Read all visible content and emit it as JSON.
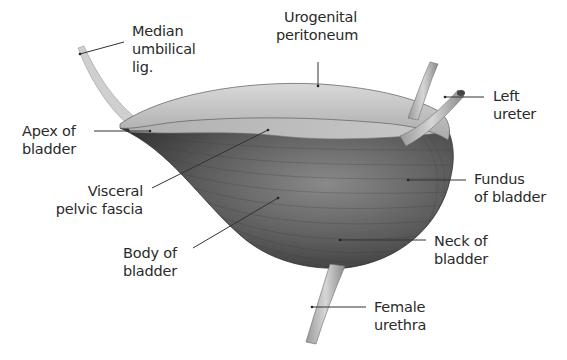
{
  "figure": {
    "colors": {
      "muscle_dark": "#4a4a4a",
      "muscle_mid": "#7a7a7a",
      "peritoneum": "#bdbdbd",
      "line": "#333333"
    }
  },
  "labels": [
    {
      "id": "median-umbilical-lig",
      "lines": [
        "Median",
        "umbilical",
        "lig."
      ]
    },
    {
      "id": "urogenital-peritoneum",
      "lines": [
        "Urogenital",
        "peritoneum"
      ]
    },
    {
      "id": "left-ureter",
      "lines": [
        "Left",
        "ureter"
      ]
    },
    {
      "id": "apex-of-bladder",
      "lines": [
        "Apex of",
        "bladder"
      ]
    },
    {
      "id": "visceral-pelvic-fascia",
      "lines": [
        "Visceral",
        "pelvic fascia"
      ]
    },
    {
      "id": "fundus-of-bladder",
      "lines": [
        "Fundus",
        "of bladder"
      ]
    },
    {
      "id": "body-of-bladder",
      "lines": [
        "Body of",
        "bladder"
      ]
    },
    {
      "id": "neck-of-bladder",
      "lines": [
        "Neck of",
        "bladder"
      ]
    },
    {
      "id": "female-urethra",
      "lines": [
        "Female",
        "urethra"
      ]
    }
  ]
}
